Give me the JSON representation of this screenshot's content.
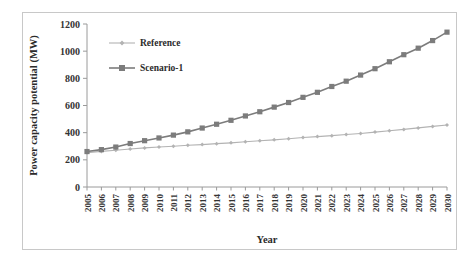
{
  "chart_data": {
    "type": "line",
    "title": "",
    "xlabel": "Year",
    "ylabel": "Power capacity potential (MW)",
    "grid": false,
    "legend_position": "upper-left-inside",
    "xlim": [
      2005,
      2030
    ],
    "ylim": [
      0,
      1200
    ],
    "ytick_values": [
      0,
      200,
      400,
      600,
      800,
      1000,
      1200
    ],
    "ytick_labels": [
      "0",
      "200",
      "400",
      "600",
      "800",
      "1000",
      "1200"
    ],
    "categories": [
      "2005",
      "2006",
      "2007",
      "2008",
      "2009",
      "2010",
      "2011",
      "2012",
      "2013",
      "2014",
      "2015",
      "2016",
      "2017",
      "2018",
      "2019",
      "2020",
      "2021",
      "2022",
      "2023",
      "2024",
      "2025",
      "2026",
      "2027",
      "2028",
      "2029",
      "2030"
    ],
    "series": [
      {
        "name": "Reference",
        "color": "#b3b3b3",
        "marker": "diamond",
        "values": [
          253,
          262,
          271,
          280,
          288,
          295,
          300,
          307,
          312,
          319,
          325,
          333,
          340,
          347,
          355,
          364,
          371,
          378,
          386,
          394,
          404,
          414,
          424,
          435,
          446,
          456
        ]
      },
      {
        "name": "Scenario-1",
        "color": "#7c7c7c",
        "marker": "square",
        "values": [
          261,
          275,
          294,
          320,
          341,
          361,
          382,
          406,
          434,
          462,
          491,
          523,
          554,
          588,
          622,
          660,
          697,
          740,
          779,
          824,
          871,
          922,
          974,
          1022,
          1078,
          1140
        ]
      }
    ]
  },
  "legend": {
    "items": [
      {
        "label": "Reference"
      },
      {
        "label": "Scenario-1"
      }
    ]
  },
  "colors": {
    "reference": "#b3b3b3",
    "scenario1": "#7c7c7c",
    "axis": "#9a9a9a",
    "text": "#2b2b2b",
    "border": "#c8c8c8"
  }
}
